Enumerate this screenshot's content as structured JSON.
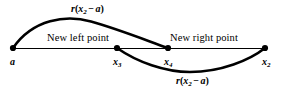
{
  "figure": {
    "type": "golden-section-search-diagram",
    "background_color": "#ffffff",
    "stroke_color": "#000000",
    "baseline": {
      "y": 48,
      "x_start": 13,
      "x_end": 265
    },
    "nodes": [
      {
        "id": "a",
        "label_prefix": "a",
        "subscript": "",
        "x": 13,
        "y": 48
      },
      {
        "id": "x3",
        "label_prefix": "x",
        "subscript": "3",
        "x": 117,
        "y": 48
      },
      {
        "id": "x4",
        "label_prefix": "x",
        "subscript": "4",
        "x": 168,
        "y": 48
      },
      {
        "id": "x2",
        "label_prefix": "x",
        "subscript": "2",
        "x": 265,
        "y": 48
      }
    ],
    "arcs": [
      {
        "id": "upper-arc",
        "from": "a",
        "to": "x4",
        "direction": "above",
        "peak": {
          "x": 90,
          "y": 22
        }
      },
      {
        "id": "lower-arc",
        "from": "x3",
        "to": "x2",
        "direction": "below",
        "trough": {
          "x": 190,
          "y": 72
        }
      }
    ],
    "labels": {
      "arc_top": {
        "prefix": "r",
        "open": "(",
        "var": "x",
        "subscript": "2",
        "operator": "−",
        "term": "a",
        "close": ")"
      },
      "arc_bottom": {
        "prefix": "r",
        "open": "(",
        "var": "x",
        "subscript": "2",
        "operator": "−",
        "term": "a",
        "close": ")"
      },
      "new_left_point": "New left point",
      "new_right_point": "New right point"
    }
  }
}
